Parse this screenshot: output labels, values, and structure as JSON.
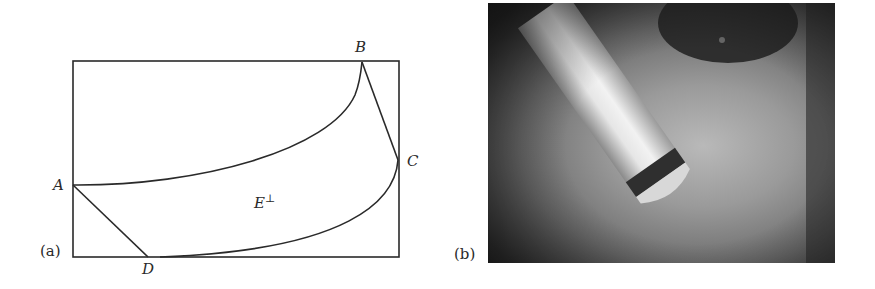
{
  "figure": {
    "panel_a": {
      "label": "(a)",
      "points": {
        "A": "A",
        "B": "B",
        "C": "C",
        "D": "D"
      },
      "region_label": "E",
      "region_superscript": "⊥"
    },
    "panel_b": {
      "label": "(b)",
      "description": "Grayscale photograph of a cylindrical probe with a dark band near its rounded tip, angled diagonally over a gray surface"
    }
  },
  "colors": {
    "line": "#2a2a2a",
    "background": "#ffffff"
  }
}
